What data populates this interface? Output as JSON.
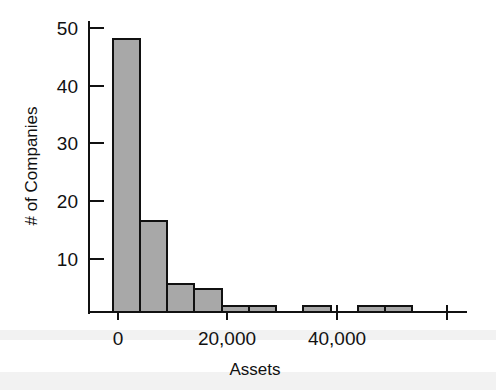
{
  "chart_data": {
    "type": "bar",
    "title": "",
    "subtitle": "",
    "xlabel": "Assets",
    "ylabel": "# of Companies",
    "grid": false,
    "legend": false,
    "legend_position": "none",
    "bin_width": 5000,
    "bin_start": -1000,
    "xlim": [
      -3000,
      63000
    ],
    "ylim": [
      0,
      52
    ],
    "x_tick_labels": [
      "0",
      "20,000",
      "40,000"
    ],
    "x_tick_values": [
      0,
      20000,
      40000,
      60000
    ],
    "y_tick_labels": [
      "10",
      "20",
      "30",
      "40",
      "50"
    ],
    "y_tick_values": [
      10,
      20,
      30,
      40,
      50
    ],
    "categories": [
      "-1,000–4,000",
      "4,000–9,000",
      "9,000–14,000",
      "14,000–19,000",
      "19,000–24,000",
      "24,000–29,000",
      "29,000–34,000",
      "34,000–39,000",
      "39,000–44,000",
      "44,000–49,000",
      "49,000–54,000"
    ],
    "values": [
      48,
      16,
      5,
      4,
      1,
      1,
      0,
      1,
      0,
      1,
      1
    ],
    "bar_fill_color": "#a8a8a8",
    "bar_edge_color": "#111111",
    "axis_color": "#111111",
    "background_color": "#ffffff"
  },
  "axes": {
    "x_title": "Assets",
    "y_title": "# of Companies"
  },
  "ticks": {
    "x": [
      {
        "label": "0",
        "value": 0
      },
      {
        "label": "20,000",
        "value": 20000
      },
      {
        "label": "40,000",
        "value": 40000
      },
      {
        "label": "",
        "value": 60000
      }
    ],
    "y": [
      {
        "label": "10",
        "value": 10
      },
      {
        "label": "20",
        "value": 20
      },
      {
        "label": "30",
        "value": 30
      },
      {
        "label": "40",
        "value": 40
      },
      {
        "label": "50",
        "value": 50
      }
    ]
  }
}
